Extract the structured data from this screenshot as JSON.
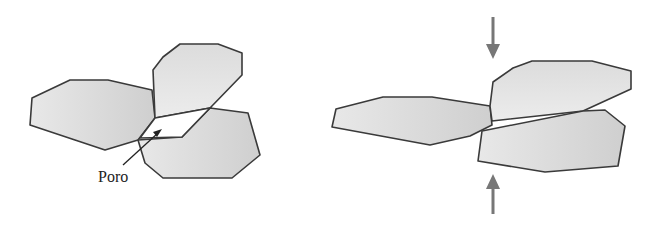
{
  "diagram": {
    "left_panel": {
      "name": "before-compaction",
      "label": "Poro",
      "grain_count": 3
    },
    "right_panel": {
      "name": "after-compaction",
      "grain_count": 3,
      "arrows": [
        "down",
        "up"
      ]
    },
    "colors": {
      "grain_fill": "#d9d9d9",
      "grain_stroke": "#3a3a3a",
      "arrow": "#777777",
      "background": "#ffffff"
    }
  }
}
